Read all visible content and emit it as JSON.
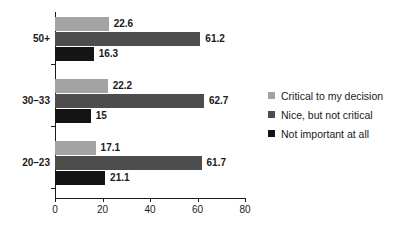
{
  "chart_data": {
    "type": "bar",
    "orientation": "horizontal",
    "title": "",
    "subtitle": "",
    "xlabel": "",
    "ylabel": "",
    "xlim": [
      0,
      80
    ],
    "xticks": [
      0,
      20,
      40,
      60,
      80
    ],
    "grid": false,
    "legend_position": "right",
    "categories": [
      "50+",
      "30–33",
      "20–23"
    ],
    "series": [
      {
        "name": "Critical to my decision",
        "color": "#a3a3a3",
        "values": [
          22.6,
          22.2,
          17.1
        ],
        "labels": [
          "22.6",
          "22.2",
          "17.1"
        ]
      },
      {
        "name": "Nice, but not critical",
        "color": "#4d4d4d",
        "values": [
          61.2,
          62.7,
          61.7
        ],
        "labels": [
          "61.2",
          "62.7",
          "61.7"
        ]
      },
      {
        "name": "Not important at all",
        "color": "#141414",
        "values": [
          16.3,
          15,
          21.1
        ],
        "labels": [
          "16.3",
          "15",
          "21.1"
        ]
      }
    ]
  },
  "axis": {
    "tick_labels": [
      "0",
      "20",
      "40",
      "60",
      "80"
    ]
  },
  "categories": {
    "items": [
      {
        "label": "50+"
      },
      {
        "label": "30–33"
      },
      {
        "label": "20–23"
      }
    ]
  },
  "legend": {
    "items": [
      {
        "label": "Critical to my decision",
        "color": "#a3a3a3"
      },
      {
        "label": "Nice, but not critical",
        "color": "#4d4d4d"
      },
      {
        "label": "Not important at all",
        "color": "#141414"
      }
    ]
  },
  "colors": {
    "series_light": "#a3a3a3",
    "series_mid": "#4d4d4d",
    "series_dark": "#141414",
    "axis": "#1a1a1a",
    "background": "#ffffff"
  }
}
